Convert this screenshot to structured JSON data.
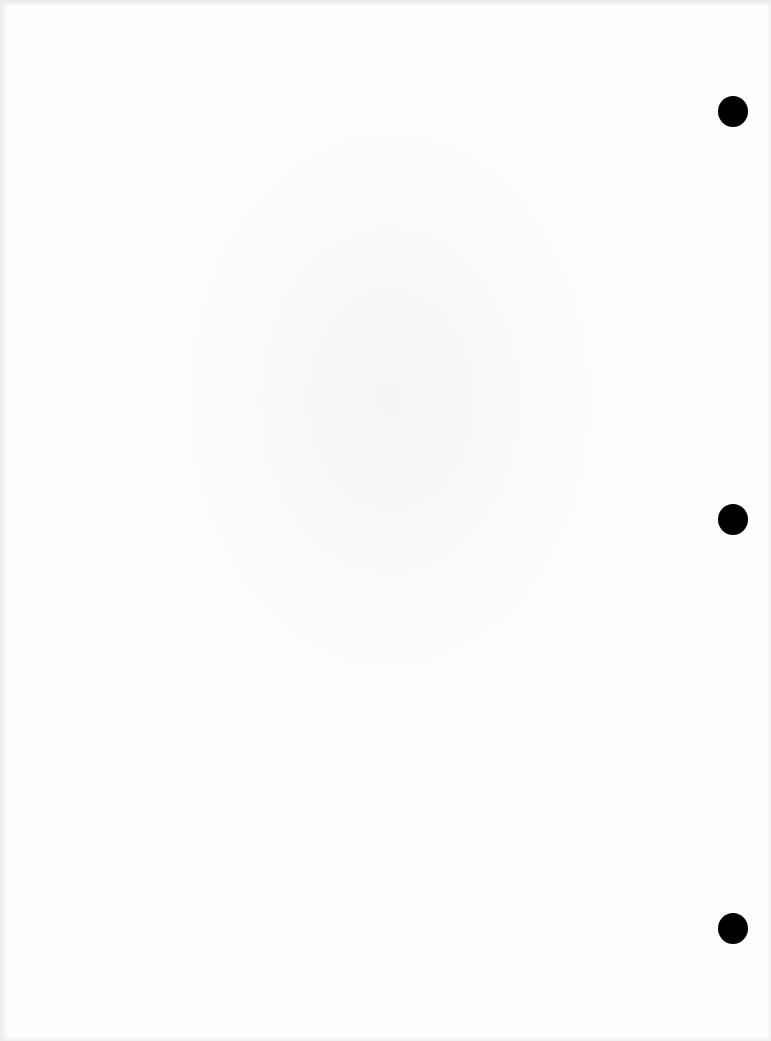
{
  "document": {
    "type": "blank scanned page",
    "text_content": "",
    "background_color": "#fdfdfd",
    "punch_holes": [
      {
        "label": "top",
        "cx": 733,
        "cy": 111,
        "radius": 15,
        "color": "#000000"
      },
      {
        "label": "middle",
        "cx": 733,
        "cy": 519,
        "radius": 15,
        "color": "#000000"
      },
      {
        "label": "bottom",
        "cx": 733,
        "cy": 928,
        "radius": 15,
        "color": "#000000"
      }
    ]
  }
}
